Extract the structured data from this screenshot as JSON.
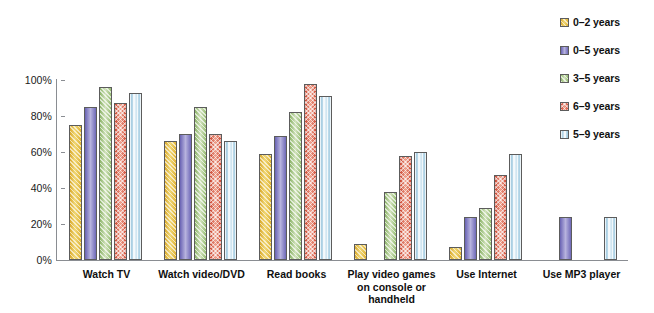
{
  "chart_data": {
    "type": "bar",
    "title": "",
    "subtitle": "",
    "xlabel": "",
    "ylabel": "",
    "ylim": [
      0,
      100
    ],
    "ytick_labels": [
      "100%",
      "80%",
      "60%",
      "40%",
      "20%",
      "0%"
    ],
    "ytick_values": [
      100,
      80,
      60,
      40,
      20,
      0
    ],
    "grid": false,
    "legend_position": "right",
    "categories": [
      "Watch TV",
      "Watch video/DVD",
      "Read books",
      "Play video games\non console or\nhandheld",
      "Use Internet",
      "Use MP3 player"
    ],
    "series": [
      {
        "name": "0–2 years",
        "color": "#e6bf3e",
        "pattern": "diagonal-hatch",
        "values": [
          75,
          66,
          59,
          9,
          7,
          null
        ]
      },
      {
        "name": "0–5 years",
        "color": "#7b76c2",
        "pattern": "solid",
        "values": [
          85,
          70,
          69,
          null,
          24,
          24
        ]
      },
      {
        "name": "3–5 years",
        "color": "#9cc07a",
        "pattern": "diagonal-hatch",
        "values": [
          96,
          85,
          82,
          38,
          29,
          null
        ]
      },
      {
        "name": "6–9 years",
        "color": "#d9543c",
        "pattern": "cross-hatch",
        "values": [
          87,
          70,
          98,
          58,
          47,
          null
        ]
      },
      {
        "name": "5–9 years",
        "color": "#acd0e4",
        "pattern": "vertical-lines",
        "values": [
          93,
          66,
          91,
          60,
          59,
          24
        ]
      }
    ]
  },
  "legend": {
    "items": [
      {
        "label": "0–2 years"
      },
      {
        "label": "0–5 years"
      },
      {
        "label": "3–5 years"
      },
      {
        "label": "6–9 years"
      },
      {
        "label": "5–9 years"
      }
    ]
  }
}
